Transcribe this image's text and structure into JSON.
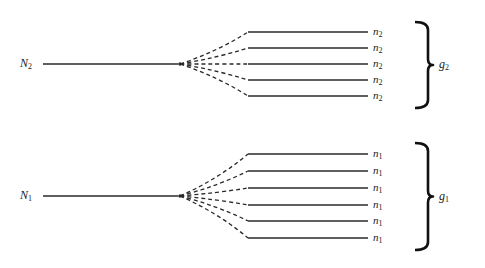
{
  "diagram": {
    "type": "splitting-tree",
    "colors": {
      "line": "#2a2a2a",
      "text": "#222222",
      "background": "#ffffff"
    },
    "groups": [
      {
        "id": "group-2",
        "root": {
          "label": "N",
          "sub": "2",
          "y": 64
        },
        "branch_labels": [
          {
            "label": "n",
            "sub": "2"
          },
          {
            "label": "n",
            "sub": "2"
          },
          {
            "label": "n",
            "sub": "2"
          },
          {
            "label": "n",
            "sub": "2"
          },
          {
            "label": "n",
            "sub": "2"
          }
        ],
        "branch_y": [
          32,
          48,
          64,
          80,
          96
        ],
        "brace": {
          "label": "g",
          "sub": "2",
          "top": 22,
          "bottom": 108
        }
      },
      {
        "id": "group-1",
        "root": {
          "label": "N",
          "sub": "1",
          "y": 196
        },
        "branch_labels": [
          {
            "label": "n",
            "sub": "1"
          },
          {
            "label": "n",
            "sub": "1"
          },
          {
            "label": "n",
            "sub": "1"
          },
          {
            "label": "n",
            "sub": "1"
          },
          {
            "label": "n",
            "sub": "1"
          },
          {
            "label": "n",
            "sub": "1"
          }
        ],
        "branch_y": [
          154,
          171,
          188,
          205,
          221,
          238
        ],
        "brace": {
          "label": "g",
          "sub": "1",
          "top": 143,
          "bottom": 250
        }
      }
    ]
  }
}
